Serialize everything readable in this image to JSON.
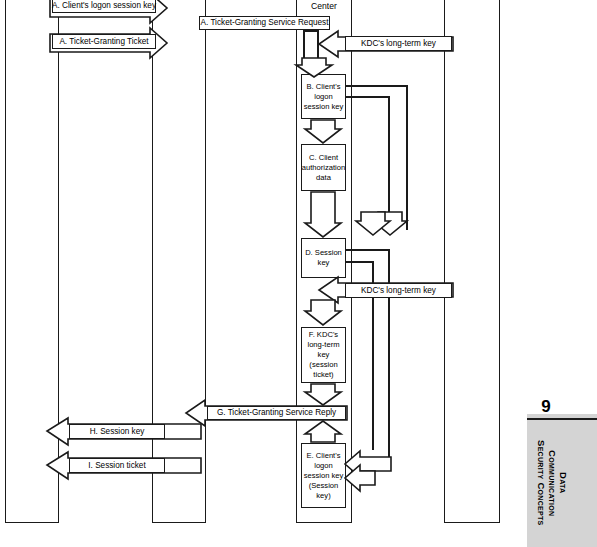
{
  "page": {
    "number": "9",
    "margin_title_lines": [
      "Data",
      "Communication",
      "Security Concepts"
    ]
  },
  "diagram": {
    "type": "kerberos-ticket-granting-sequence-diagram",
    "column_headers": [
      {
        "label": "Center"
      }
    ],
    "lifelines": [
      {
        "name": "lifeline-1"
      },
      {
        "name": "lifeline-2"
      },
      {
        "name": "lifeline-3"
      },
      {
        "name": "lifeline-4"
      }
    ],
    "messages": [
      {
        "id": "A1",
        "label": "A. Client's logon session key",
        "direction": "right"
      },
      {
        "id": "A2",
        "label": "A. Ticket-Granting Ticket",
        "direction": "right"
      },
      {
        "id": "A3",
        "label": "A. Ticket-Granting Service Request",
        "direction": "right"
      },
      {
        "id": "K1",
        "label": "KDC's long-term key",
        "direction": "left"
      },
      {
        "id": "K2",
        "label": "KDC's long-term key",
        "direction": "left"
      },
      {
        "id": "G",
        "label": "G. Ticket-Granting Service Reply",
        "direction": "left"
      },
      {
        "id": "H",
        "label": "H. Session key",
        "direction": "left"
      },
      {
        "id": "I",
        "label": "I. Session ticket",
        "direction": "left"
      }
    ],
    "process_boxes": [
      {
        "id": "B",
        "label": "B. Client's logon session key"
      },
      {
        "id": "C",
        "label": "C. Client authorization data"
      },
      {
        "id": "D",
        "label": "D. Session key"
      },
      {
        "id": "F",
        "label": "F. KDC's long-term key (session ticket)"
      },
      {
        "id": "E",
        "label": "E. Client's logon session key (Session key)"
      }
    ],
    "colors": {
      "stroke": "#1a1a1a",
      "fill": "#ffffff",
      "margin_tab": "#d4d4d4"
    }
  }
}
